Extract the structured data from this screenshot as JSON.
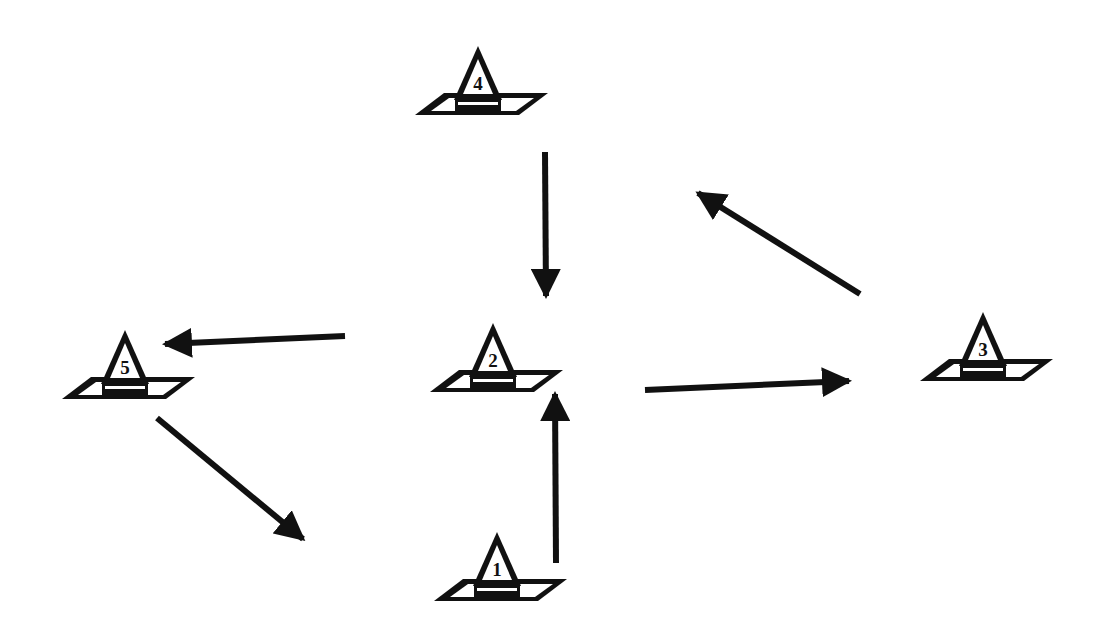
{
  "diagram": {
    "stroke_color": "#111111",
    "background": "#ffffff",
    "cones": [
      {
        "id": "1",
        "label": "1",
        "x": 497,
        "y": 532
      },
      {
        "id": "2",
        "label": "2",
        "x": 493,
        "y": 323
      },
      {
        "id": "3",
        "label": "3",
        "x": 983,
        "y": 312
      },
      {
        "id": "4",
        "label": "4",
        "x": 478,
        "y": 46
      },
      {
        "id": "5",
        "label": "5",
        "x": 125,
        "y": 330
      }
    ],
    "arrows": [
      {
        "from": "4",
        "to": "2",
        "x1": 545,
        "y1": 152,
        "x2": 546,
        "y2": 298
      },
      {
        "from": "1",
        "to": "2",
        "x1": 556,
        "y1": 563,
        "x2": 555,
        "y2": 392
      },
      {
        "from": "2",
        "to": "3",
        "x1": 645,
        "y1": 390,
        "x2": 851,
        "y2": 381
      },
      {
        "from": "3",
        "to": "4",
        "x1": 860,
        "y1": 294,
        "x2": 696,
        "y2": 192
      },
      {
        "from": "2",
        "to": "5",
        "x1": 345,
        "y1": 336,
        "x2": 163,
        "y2": 344
      },
      {
        "from": "5",
        "to": "1",
        "x1": 157,
        "y1": 418,
        "x2": 305,
        "y2": 540
      }
    ]
  }
}
